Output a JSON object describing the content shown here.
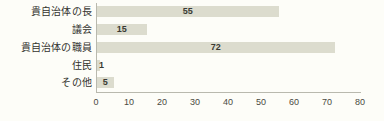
{
  "chart_data": {
    "type": "bar",
    "orientation": "horizontal",
    "title": "",
    "xlabel": "",
    "ylabel": "",
    "categories": [
      "貴自治体の長",
      "議会",
      "貴自治体の職員",
      "住民",
      "その他"
    ],
    "values": [
      55,
      15,
      72,
      1,
      5
    ],
    "xlim": [
      0,
      80
    ],
    "xticks": [
      0,
      10,
      20,
      30,
      40,
      50,
      60,
      70,
      80
    ],
    "xtick_labels": [
      "0",
      "10",
      "20",
      "30",
      "40",
      "50",
      "60",
      "70",
      "80"
    ],
    "value_labels": [
      "55",
      "15",
      "72",
      "1",
      "5"
    ],
    "grid": false,
    "legend": false,
    "bar_color": "#dcdcce",
    "axis_color": "#b9b9ae",
    "text_color": "#33332e",
    "background_color": "#fdfdf8"
  }
}
